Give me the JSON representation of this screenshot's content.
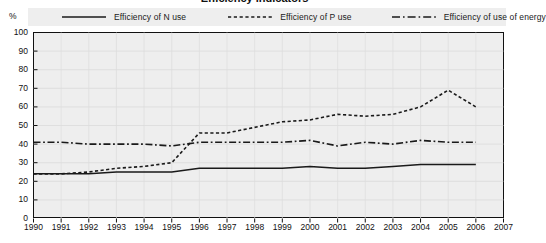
{
  "title": "Efficiency indicators",
  "axis": {
    "y_unit": "%",
    "y_ticks": [
      100,
      90,
      80,
      70,
      60,
      50,
      40,
      30,
      20,
      10,
      0
    ],
    "x_ticks": [
      1990,
      1991,
      1992,
      1993,
      1994,
      1995,
      1996,
      1997,
      1998,
      1999,
      2000,
      2001,
      2002,
      2003,
      2004,
      2005,
      2006,
      2007
    ]
  },
  "legend": {
    "items": [
      {
        "label": "Efficiency of N use",
        "style": "solid",
        "color": "#1a1a1a"
      },
      {
        "label": "Efficiency of P use",
        "style": "dotted",
        "color": "#1a1a1a"
      },
      {
        "label": "Efficiency of use of energy",
        "style": "dash-dot",
        "color": "#1a1a1a"
      }
    ]
  },
  "colors": {
    "plot_background": "#eeeeee",
    "legend_background": "#eeeeee",
    "axis": "#111111",
    "series": "#1a1a1a"
  },
  "chart_data": {
    "type": "line",
    "title": "Efficiency indicators",
    "xlabel": "",
    "ylabel": "%",
    "ylim": [
      0,
      100
    ],
    "xlim": [
      1990,
      2007
    ],
    "grid": true,
    "legend_position": "top",
    "x": [
      1990,
      1991,
      1992,
      1993,
      1994,
      1995,
      1996,
      1997,
      1998,
      1999,
      2000,
      2001,
      2002,
      2003,
      2004,
      2005,
      2006
    ],
    "categories": [
      "1990",
      "1991",
      "1992",
      "1993",
      "1994",
      "1995",
      "1996",
      "1997",
      "1998",
      "1999",
      "2000",
      "2001",
      "2002",
      "2003",
      "2004",
      "2005",
      "2006"
    ],
    "series": [
      {
        "name": "Efficiency of N use",
        "style": "solid",
        "values": [
          24,
          24,
          24,
          25,
          25,
          25,
          27,
          27,
          27,
          27,
          28,
          27,
          27,
          28,
          29,
          29,
          29
        ]
      },
      {
        "name": "Efficiency of P use",
        "style": "dotted",
        "values": [
          24,
          24,
          25,
          27,
          28,
          30,
          46,
          46,
          49,
          52,
          53,
          56,
          55,
          56,
          60,
          69,
          60
        ]
      },
      {
        "name": "Efficiency of use of energy",
        "style": "dash-dot",
        "values": [
          41,
          41,
          40,
          40,
          40,
          39,
          41,
          41,
          41,
          41,
          42,
          39,
          41,
          40,
          42,
          41,
          41
        ]
      }
    ]
  }
}
